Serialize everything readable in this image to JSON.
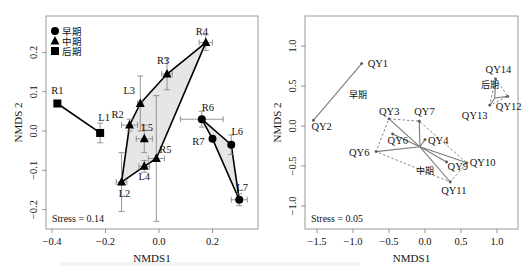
{
  "chart_data": [
    {
      "type": "scatter",
      "title": "",
      "xlabel": "NMDS1",
      "ylabel": "NMDS 2",
      "xlim": [
        -0.42,
        0.37
      ],
      "ylim": [
        -0.255,
        0.295
      ],
      "xticks": [
        -0.4,
        -0.2,
        0.0,
        0.2
      ],
      "xtick_labels": [
        "−0.4",
        "−0.2",
        "0.0",
        "0.2"
      ],
      "yticks": [
        -0.2,
        -0.1,
        0.0,
        0.1,
        0.2
      ],
      "ytick_labels": [
        "−0.2",
        "−0.1",
        "0.0",
        "0.1",
        "0.2"
      ],
      "grid": false,
      "legend_position": "top-left",
      "legend": [
        {
          "label": "早期",
          "marker": "circle"
        },
        {
          "label": "中期",
          "marker": "triangle"
        },
        {
          "label": "后期",
          "marker": "square"
        }
      ],
      "annotation": "Stress = 0.14",
      "points": [
        {
          "label": "R1",
          "group": "后期",
          "marker": "square",
          "x": -0.38,
          "y": 0.07,
          "xerr": 0.0,
          "yerr": 0.0,
          "lx": 0,
          "ly": -9
        },
        {
          "label": "L1",
          "group": "后期",
          "marker": "square",
          "x": -0.22,
          "y": -0.005,
          "xerr": 0.01,
          "yerr": 0.025,
          "lx": 4,
          "ly": -12
        },
        {
          "label": "R2",
          "group": "中期",
          "marker": "triangle",
          "x": -0.11,
          "y": 0.015,
          "xerr": 0.03,
          "yerr": 0.015,
          "lx": -12,
          "ly": -7
        },
        {
          "label": "L3",
          "group": "中期",
          "marker": "triangle",
          "x": -0.07,
          "y": 0.07,
          "xerr": 0.01,
          "yerr": 0.07,
          "lx": -11,
          "ly": -9
        },
        {
          "label": "R3",
          "group": "中期",
          "marker": "triangle",
          "x": 0.03,
          "y": 0.145,
          "xerr": 0.02,
          "yerr": 0.04,
          "lx": -4,
          "ly": -10
        },
        {
          "label": "R4",
          "group": "中期",
          "marker": "triangle",
          "x": 0.175,
          "y": 0.225,
          "xerr": 0.025,
          "yerr": 0.02,
          "lx": -4,
          "ly": -8
        },
        {
          "label": "L5",
          "group": "中期",
          "marker": "triangle",
          "x": -0.055,
          "y": -0.02,
          "xerr": 0.03,
          "yerr": 0.035,
          "lx": 3,
          "ly": -8
        },
        {
          "label": "R5",
          "group": "中期",
          "marker": "triangle",
          "x": -0.01,
          "y": -0.07,
          "xerr": 0.03,
          "yerr": 0.16,
          "lx": 9,
          "ly": -6
        },
        {
          "label": "L4",
          "group": "中期",
          "marker": "triangle",
          "x": -0.055,
          "y": -0.09,
          "xerr": 0.02,
          "yerr": 0.015,
          "lx": 0,
          "ly": 14
        },
        {
          "label": "L2",
          "group": "中期",
          "marker": "triangle",
          "x": -0.14,
          "y": -0.13,
          "xerr": 0.02,
          "yerr": 0.075,
          "lx": 3,
          "ly": 15
        },
        {
          "label": "R6",
          "group": "早期",
          "marker": "circle",
          "x": 0.16,
          "y": 0.03,
          "xerr": 0.08,
          "yerr": 0.02,
          "lx": 6,
          "ly": -8
        },
        {
          "label": "R7",
          "group": "早期",
          "marker": "circle",
          "x": 0.2,
          "y": -0.02,
          "xerr": 0.0,
          "yerr": 0.0,
          "lx": -14,
          "ly": 6
        },
        {
          "label": "L6",
          "group": "早期",
          "marker": "circle",
          "x": 0.27,
          "y": -0.035,
          "xerr": 0.01,
          "yerr": 0.025,
          "lx": 6,
          "ly": -10
        },
        {
          "label": "L7",
          "group": "早期",
          "marker": "circle",
          "x": 0.3,
          "y": -0.175,
          "xerr": 0.03,
          "yerr": 0.015,
          "lx": 3,
          "ly": -9
        }
      ],
      "lines": [
        [
          "R1",
          "L1"
        ]
      ],
      "hulls": [
        {
          "group": "中期",
          "vertices": [
            "L2",
            "R2",
            "L3",
            "R3",
            "R4",
            "R5",
            "L4"
          ],
          "fill": "#e6e6e6"
        },
        {
          "group": "早期",
          "vertices": [
            "R6",
            "L6",
            "L7",
            "R7"
          ],
          "fill": "#e6e6e6"
        }
      ]
    },
    {
      "type": "scatter",
      "title": "",
      "xlabel": "NMDS1",
      "ylabel": "NMDS 2",
      "xlim": [
        -1.62,
        1.27
      ],
      "ylim": [
        -1.28,
        1.38
      ],
      "xticks": [
        -1.5,
        -1.0,
        -0.5,
        0.0,
        0.5,
        1.0
      ],
      "xtick_labels": [
        "−1.5",
        "−1.0",
        "−0.5",
        "0.0",
        "0.5",
        "1.0"
      ],
      "yticks": [
        -1.0,
        -0.5,
        0.0,
        0.5,
        1.0
      ],
      "ytick_labels": [
        "−1.0",
        "−0.5",
        "0.0",
        "0.5",
        "1.0"
      ],
      "grid": false,
      "annotation": "Stress = 0.05",
      "groups": [
        {
          "name": "早期",
          "label_x": -1.05,
          "label_y": 0.35,
          "centroid": null
        },
        {
          "name": "中期",
          "label_x": -0.12,
          "label_y": -0.6,
          "centroid": [
            -0.07,
            -0.26
          ]
        },
        {
          "name": "后期",
          "label_x": 0.78,
          "label_y": 0.47,
          "centroid": [
            0.97,
            0.35
          ]
        }
      ],
      "points": [
        {
          "label": "QY1",
          "group": "早期",
          "x": -0.88,
          "y": 0.78,
          "lx": 6,
          "ly": 3
        },
        {
          "label": "QY2",
          "group": "早期",
          "x": -1.55,
          "y": 0.07,
          "lx": -2,
          "ly": 10
        },
        {
          "label": "QY3",
          "group": "中期",
          "x": -0.5,
          "y": 0.09,
          "lx": -10,
          "ly": -4
        },
        {
          "label": "QY7",
          "group": "中期",
          "x": -0.08,
          "y": 0.06,
          "lx": -5,
          "ly": -6
        },
        {
          "label": "QY6",
          "group": "中期",
          "x": -0.45,
          "y": -0.1,
          "lx": -5,
          "ly": 10
        },
        {
          "label": "QY4",
          "group": "中期",
          "x": 0.0,
          "y": -0.17,
          "lx": 3,
          "ly": 4
        },
        {
          "label": "QY6",
          "group": "中期",
          "x": -0.68,
          "y": -0.32,
          "lx": -27,
          "ly": 4
        },
        {
          "label": "QY9",
          "group": "中期",
          "x": 0.3,
          "y": -0.45,
          "lx": 1,
          "ly": 8
        },
        {
          "label": "QY10",
          "group": "中期",
          "x": 0.58,
          "y": -0.46,
          "lx": 3,
          "ly": 3
        },
        {
          "label": "QY11",
          "group": "中期",
          "x": 0.35,
          "y": -0.7,
          "lx": -9,
          "ly": 12
        },
        {
          "label": "QY14",
          "group": "后期",
          "x": 0.98,
          "y": 0.59,
          "lx": -10,
          "ly": -6
        },
        {
          "label": "QY12",
          "group": "后期",
          "x": 1.15,
          "y": 0.37,
          "lx": -12,
          "ly": 14
        },
        {
          "label": "QY13",
          "group": "后期",
          "x": 0.9,
          "y": 0.26,
          "lx": -28,
          "ly": 14
        }
      ],
      "solid_lines": [
        [
          "QY1",
          "QY2"
        ]
      ],
      "hulls": [
        {
          "group": "中期",
          "vertices": [
            "QY3",
            "QY7",
            "QY10",
            "QY11",
            "QY6b"
          ]
        },
        {
          "group": "后期",
          "vertices": [
            "QY14",
            "QY12",
            "QY13"
          ]
        }
      ]
    }
  ]
}
